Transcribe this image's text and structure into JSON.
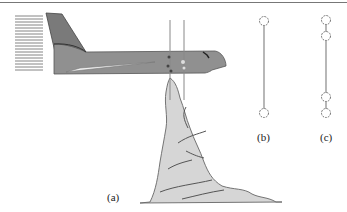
{
  "figure": {
    "panels": [
      {
        "id": "a",
        "label": "(a)",
        "description": "aircraft-with-probe-beams-over-cloud"
      },
      {
        "id": "b",
        "label": "(b)",
        "description": "two-particles-connected-by-line"
      },
      {
        "id": "c",
        "label": "(c)",
        "description": "four-particles-pairs-connected-by-line"
      }
    ],
    "colors": {
      "aircraft_body": "#8f8f8f",
      "aircraft_tail": "#7a7a7a",
      "wing": "#eeeeee",
      "cloud_fill": "#d6d6d6",
      "cloud_stroke": "#555555",
      "lines": "#888888",
      "background": "#ffffff"
    }
  }
}
